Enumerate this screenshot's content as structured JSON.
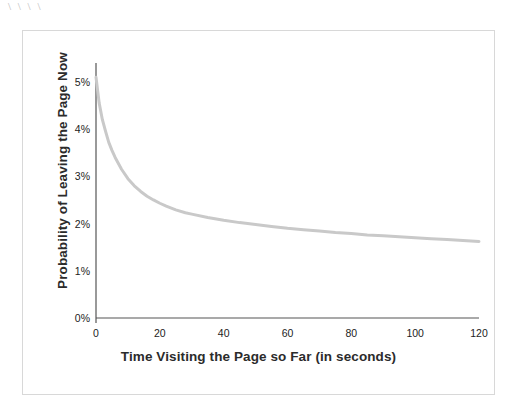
{
  "artifact": {
    "marks": "\\ \\ \\ \\"
  },
  "chart_data": {
    "type": "line",
    "title": "",
    "xlabel": "Time Visiting the Page so Far (in seconds)",
    "ylabel": "Probability of Leaving the Page Now",
    "xlim": [
      0,
      120
    ],
    "ylim": [
      0,
      5.4
    ],
    "grid": false,
    "legend": null,
    "legend_position": "none",
    "xticks": [
      0,
      20,
      40,
      60,
      80,
      100,
      120
    ],
    "xticklabels": [
      "0",
      "20",
      "40",
      "60",
      "80",
      "100",
      "120"
    ],
    "yticks": [
      0,
      1,
      2,
      3,
      4,
      5
    ],
    "yticklabels": [
      "0%",
      "1%",
      "2%",
      "3%",
      "4%",
      "5%"
    ],
    "series": [
      {
        "name": "Probability of Leaving the Page Now",
        "color": "#c9c9c9",
        "linewidth": 3,
        "x": [
          0,
          1,
          2,
          3,
          4,
          5,
          6,
          8,
          10,
          12,
          14,
          16,
          18,
          20,
          22,
          25,
          28,
          30,
          35,
          40,
          45,
          50,
          55,
          60,
          65,
          70,
          75,
          80,
          85,
          90,
          95,
          100,
          105,
          110,
          115,
          120
        ],
        "values": [
          5.1,
          4.55,
          4.2,
          3.95,
          3.72,
          3.55,
          3.4,
          3.15,
          2.95,
          2.8,
          2.68,
          2.58,
          2.5,
          2.43,
          2.37,
          2.29,
          2.23,
          2.2,
          2.13,
          2.07,
          2.02,
          1.98,
          1.94,
          1.9,
          1.87,
          1.84,
          1.81,
          1.79,
          1.76,
          1.74,
          1.72,
          1.7,
          1.68,
          1.66,
          1.64,
          1.62
        ]
      }
    ],
    "axis_color": "#555555",
    "frame_color": "#d8d8d8",
    "background": "#ffffff"
  }
}
